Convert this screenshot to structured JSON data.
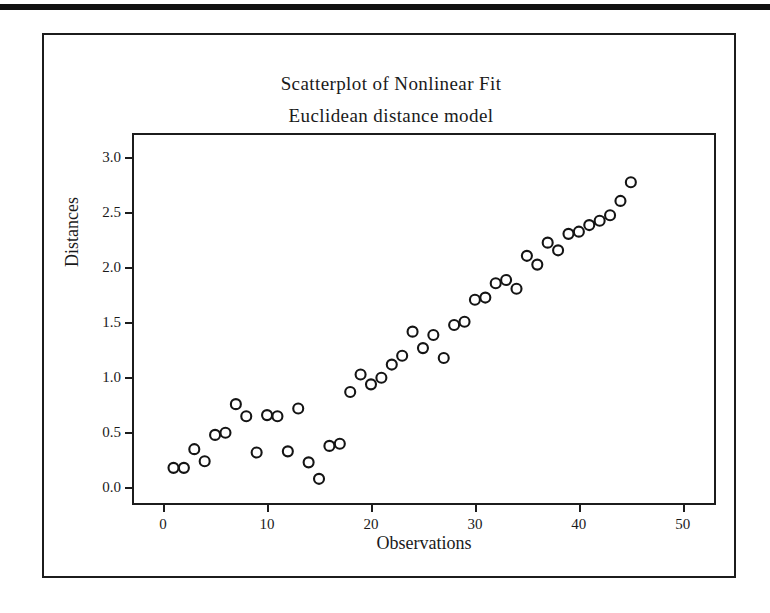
{
  "figure": {
    "title": "Scatterplot of Nonlinear Fit",
    "subtitle": "Euclidean distance model",
    "frame_color": "#1c1c1c",
    "point_color": "#141414",
    "background": "#ffffff"
  },
  "chart_data": {
    "type": "scatter",
    "title": "Scatterplot of Nonlinear Fit",
    "subtitle": "Euclidean distance model",
    "xlabel": "Observations",
    "ylabel": "Distances",
    "xlim": [
      -2.8,
      53.0
    ],
    "ylim": [
      -0.15,
      3.2
    ],
    "xticks": [
      0,
      10,
      20,
      30,
      40,
      50
    ],
    "xtick_labels": [
      "0",
      "10",
      "20",
      "30",
      "40",
      "50"
    ],
    "yticks": [
      0.0,
      0.5,
      1.0,
      1.5,
      2.0,
      2.5,
      3.0
    ],
    "ytick_labels": [
      "0.0",
      "0.5",
      "1.0",
      "1.5",
      "2.0",
      "2.5",
      "3.0"
    ],
    "grid": false,
    "legend": null,
    "marker": "open-circle",
    "x": [
      1,
      2,
      3,
      4,
      5,
      6,
      7,
      8,
      9,
      10,
      11,
      12,
      13,
      14,
      15,
      16,
      17,
      18,
      19,
      20,
      21,
      22,
      23,
      24,
      25,
      26,
      27,
      28,
      29,
      30,
      31,
      32,
      33,
      34,
      35,
      36,
      37,
      38,
      39,
      40,
      41,
      42,
      43,
      44,
      45
    ],
    "y": [
      0.17,
      0.17,
      0.34,
      0.23,
      0.47,
      0.49,
      0.75,
      0.64,
      0.31,
      0.65,
      0.64,
      0.32,
      0.71,
      0.22,
      0.07,
      0.37,
      0.39,
      0.86,
      1.02,
      0.93,
      0.99,
      1.11,
      1.19,
      1.41,
      1.26,
      1.38,
      1.17,
      1.47,
      1.5,
      1.7,
      1.72,
      1.85,
      1.88,
      1.8,
      2.1,
      2.02,
      2.22,
      2.15,
      2.3,
      2.32,
      2.38,
      2.42,
      2.47,
      2.6,
      2.77
    ]
  }
}
